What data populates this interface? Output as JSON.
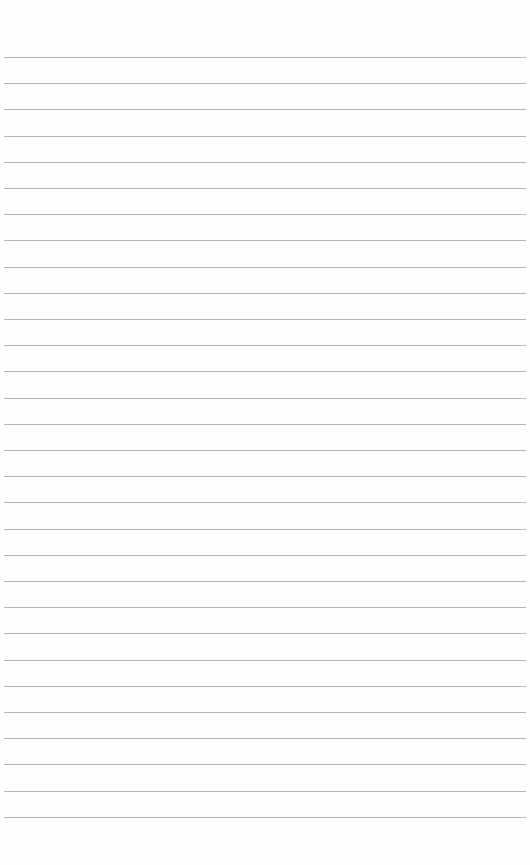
{
  "page": {
    "type": "lined-paper",
    "background": "#fefefe",
    "line_color": "#b4b4b4",
    "line_count": 30,
    "first_line_y": 57,
    "line_spacing": 26.2,
    "line_left": 4,
    "line_width": 522
  }
}
